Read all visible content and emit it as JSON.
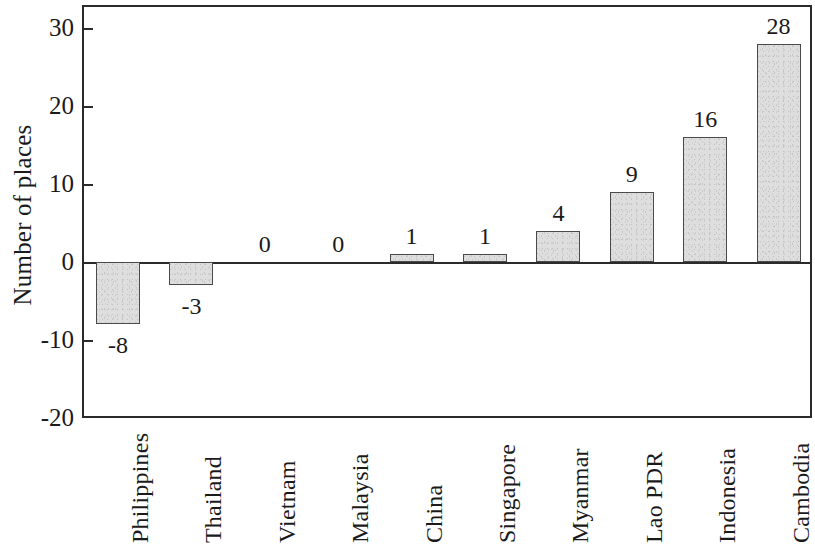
{
  "chart_data": {
    "type": "bar",
    "title": "",
    "xlabel": "",
    "ylabel": "Number of places",
    "ylim": [
      -20,
      30
    ],
    "yticks": [
      30,
      20,
      10,
      0,
      -10,
      -20
    ],
    "ytick_labels": [
      "30",
      "20",
      "10",
      "0",
      "-10",
      "-20"
    ],
    "grid": false,
    "legend": null,
    "categories": [
      "Philippines",
      "Thailand",
      "Vietnam",
      "Malaysia",
      "China",
      "Singapore",
      "Myanmar",
      "Lao PDR",
      "Indonesia",
      "Cambodia"
    ],
    "values": [
      -8,
      -3,
      0,
      0,
      1,
      1,
      4,
      9,
      16,
      28
    ],
    "value_labels": [
      "-8",
      "-3",
      "0",
      "0",
      "1",
      "1",
      "4",
      "9",
      "16",
      "28"
    ],
    "bar_color": "#dedede",
    "bar_edge_color": "#4a4a4a",
    "axis_color": "#2b2b2b",
    "background_color": "#ffffff"
  }
}
